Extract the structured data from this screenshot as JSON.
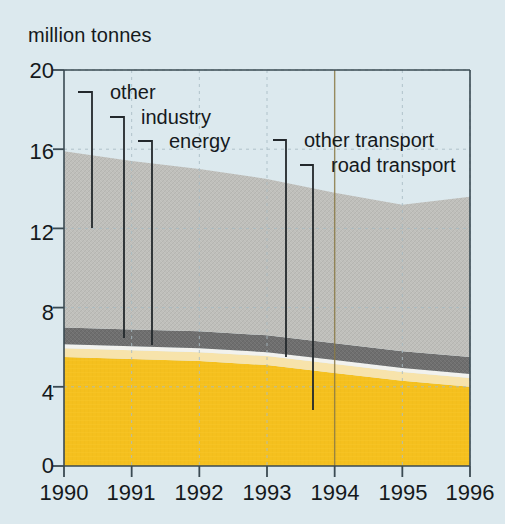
{
  "chart_data": {
    "type": "area",
    "title": "",
    "subtitle": "",
    "ylabel": "million tonnes",
    "xlabel": "",
    "stacked": true,
    "grid": true,
    "legend_position": "annotations-on-plot",
    "x": [
      1990,
      1991,
      1992,
      1993,
      1994,
      1995,
      1996
    ],
    "xtick_labels": [
      "1990",
      "1991",
      "1992",
      "1993",
      "1994",
      "1995",
      "1996"
    ],
    "ytick_labels": [
      "0",
      "4",
      "8",
      "12",
      "16",
      "20"
    ],
    "ytick_values": [
      0,
      4,
      8,
      12,
      16,
      20
    ],
    "ylim": [
      0,
      20
    ],
    "xlim": [
      1990,
      1996
    ],
    "series": [
      {
        "name": "road transport",
        "color": "#f5c01e",
        "values": [
          5.5,
          5.4,
          5.3,
          5.1,
          4.7,
          4.3,
          4.0
        ]
      },
      {
        "name": "other transport",
        "color": "#f7e3ab",
        "values": [
          0.45,
          0.45,
          0.45,
          0.45,
          0.45,
          0.45,
          0.45
        ]
      },
      {
        "name": "energy",
        "color": "#f2f2ee",
        "values": [
          0.2,
          0.2,
          0.2,
          0.2,
          0.2,
          0.2,
          0.2
        ]
      },
      {
        "name": "industry",
        "color": "#6f6f6f",
        "values": [
          0.85,
          0.85,
          0.85,
          0.85,
          0.85,
          0.85,
          0.85
        ]
      },
      {
        "name": "other",
        "color": "#bfbfbb",
        "values": [
          8.9,
          8.5,
          8.2,
          7.9,
          7.6,
          7.4,
          8.1
        ]
      }
    ],
    "stack_tops": [
      15.9,
      15.4,
      15.0,
      14.5,
      13.8,
      13.5,
      13.6
    ],
    "annotations": [
      {
        "label": "other",
        "series": "other"
      },
      {
        "label": "industry",
        "series": "industry"
      },
      {
        "label": "energy",
        "series": "energy"
      },
      {
        "label": "other transport",
        "series": "other transport"
      },
      {
        "label": "road transport",
        "series": "road transport"
      }
    ]
  },
  "colors": {
    "background": "#dce9ee",
    "axis": "#3a4a52",
    "text": "#15191c",
    "gridline": "#a9bcc4",
    "road_transport": "#f5c01e",
    "other_transport": "#f7e3ab",
    "energy": "#f2f2ee",
    "industry": "#6f6f6f",
    "other": "#bfbfbb",
    "leader": "#23282c"
  },
  "axis": {
    "ylabel_text": "million tonnes"
  }
}
